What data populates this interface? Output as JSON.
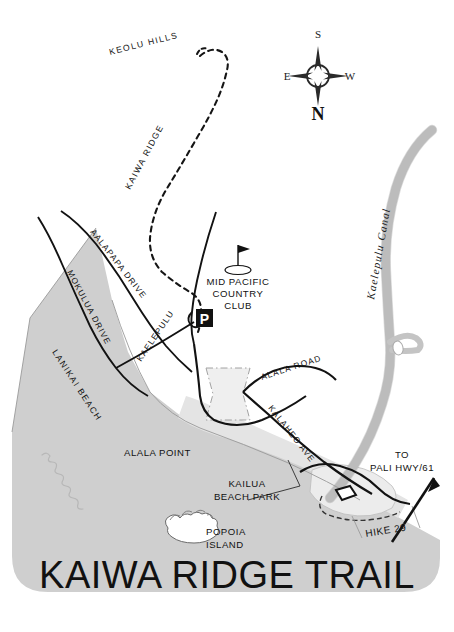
{
  "map": {
    "title": "KAIWA RIDGE TRAIL",
    "colors": {
      "land_gray": "#cfcfcf",
      "beach_gray": "#e2e2e2",
      "canal_gray": "#c9c9c9",
      "ink": "#111111",
      "paper": "#ffffff"
    },
    "compass": {
      "name": "compass-rose",
      "top": "S",
      "bottom": "N",
      "left": "E",
      "right": "W"
    },
    "trail": {
      "ridge_label": "KAIWA RIDGE",
      "hills_label": "KEOLU HILLS",
      "style": "dashed"
    },
    "roads": [
      {
        "id": "aalapapa",
        "label": "AALAPAPA DRIVE"
      },
      {
        "id": "mokulua",
        "label": "MOKULUA DRIVE"
      },
      {
        "id": "kaelepulu",
        "label": "KAELEPULU"
      },
      {
        "id": "alala-road",
        "label": "ALALA ROAD"
      },
      {
        "id": "kalaheo",
        "label": "KALAHEO AVE"
      }
    ],
    "places": [
      {
        "id": "lanikai-beach",
        "label": "LANIKAI BEACH"
      },
      {
        "id": "alala-point",
        "label": "ALALA POINT"
      },
      {
        "id": "popoia-island",
        "label_line1": "POPOIA",
        "label_line2": "ISLAND"
      },
      {
        "id": "kailua-beach-park",
        "label_line1": "KAILUA",
        "label_line2": "BEACH PARK"
      }
    ],
    "country_club": {
      "line1": "MID PACIFIC",
      "line2": "COUNTRY",
      "line3": "CLUB",
      "icon": "golf-flag-icon"
    },
    "water": {
      "canal_label": "Kaelepulu Canal"
    },
    "parking": {
      "icon": "parking-icon",
      "letter": "P"
    },
    "direction_note": {
      "line1": "TO",
      "line2": "PALI HWY/61",
      "icon": "arrow-icon"
    },
    "hike_marker": {
      "label": "HIKE 29"
    }
  }
}
